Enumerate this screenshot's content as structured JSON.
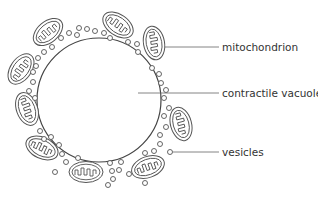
{
  "diagram": {
    "title": "",
    "labels": [
      {
        "id": "mitochondrion",
        "text": "mitochondrion"
      },
      {
        "id": "contractile-vacuole",
        "text": "contractile vacuole"
      },
      {
        "id": "vesicles",
        "text": "vesicles"
      }
    ],
    "colors": {
      "stroke": "#555555",
      "text": "#333333",
      "background": "#ffffff"
    }
  }
}
